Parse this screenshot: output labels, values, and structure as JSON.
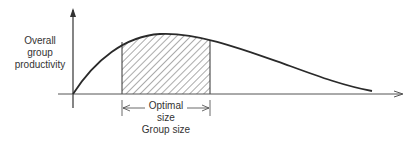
{
  "diagram": {
    "y_axis_label": [
      "Overall",
      "group",
      "productivity"
    ],
    "x_axis_label": "Group size",
    "optimal_label": [
      "Optimal",
      "size"
    ],
    "colors": {
      "line": "#2a2a2a",
      "hatch": "#444444",
      "axis": "#555555"
    }
  }
}
